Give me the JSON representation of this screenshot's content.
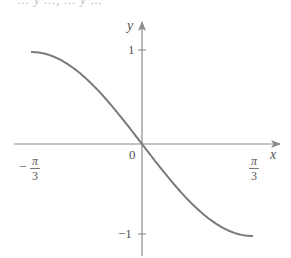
{
  "header": {
    "cut_text": "... y ..., ... y ..."
  },
  "chart_data": {
    "type": "line",
    "title": "",
    "function": "y = -sin(3x/2)",
    "xlabel": "x",
    "ylabel": "y",
    "xlim": [
      -1.047,
      1.047
    ],
    "ylim": [
      -1,
      1
    ],
    "x_ticks": [
      {
        "value": -1.047,
        "label_num": "π",
        "label_den": "3",
        "label_sign": "−"
      },
      {
        "value": 0,
        "label": "0"
      },
      {
        "value": 1.047,
        "label_num": "π",
        "label_den": "3"
      }
    ],
    "y_ticks": [
      {
        "value": 1,
        "label": "1"
      },
      {
        "value": -1,
        "label": "−1"
      }
    ],
    "series": [
      {
        "name": "curve",
        "x": [
          -1.047,
          -0.785,
          -0.524,
          -0.262,
          0,
          0.262,
          0.524,
          0.785,
          1.047
        ],
        "y": [
          0,
          0.707,
          1,
          0.707,
          0,
          -0.707,
          -1,
          -0.707,
          0
        ]
      }
    ],
    "grid": false,
    "legend": null,
    "colors": {
      "curve": "#7a7a7a",
      "axes": "#8a8a8a",
      "text": "#555555"
    }
  },
  "labels": {
    "y_axis": "y",
    "x_axis": "x",
    "origin": "0",
    "y_tick_pos": "1",
    "y_tick_neg": "−1",
    "x_tick_left_sign": "−",
    "x_tick_left_num": "π",
    "x_tick_left_den": "3",
    "x_tick_right_num": "π",
    "x_tick_right_den": "3"
  }
}
